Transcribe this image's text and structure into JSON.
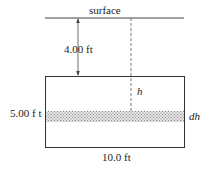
{
  "labels": {
    "surface": "surface",
    "depth": "4.00 ft",
    "height": "5.00 f t",
    "width": "10.0 ft",
    "h": "h",
    "dh": "dh"
  },
  "colors": {
    "line": "#333333",
    "hatch": "#bbbbbb"
  }
}
